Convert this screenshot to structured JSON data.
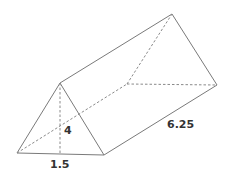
{
  "diagram": {
    "type": "triangular-prism",
    "labels": {
      "height": "4",
      "base": "1.5",
      "length": "6.25"
    },
    "colors": {
      "edge": "#7a7a7a",
      "hidden_edge": "#8a8a8a",
      "text": "#333333"
    }
  }
}
